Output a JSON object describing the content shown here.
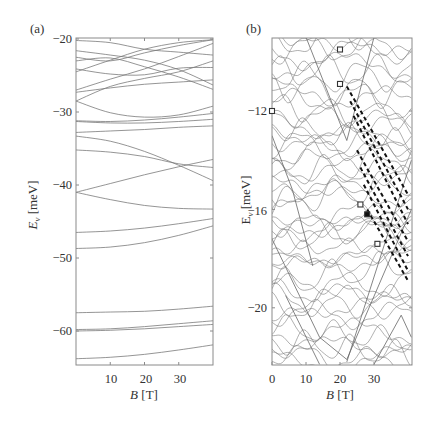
{
  "chart_data": [
    {
      "panel": "(a)",
      "type": "line",
      "title": "",
      "xlabel": "B [T]",
      "ylabel": "E_ν [meV]",
      "xlim": [
        0,
        40
      ],
      "ylim": [
        -64.6,
        -20
      ],
      "xticks": [
        10,
        20,
        30
      ],
      "yticks": [
        -20,
        -30,
        -40,
        -50,
        -60
      ],
      "grid": false,
      "legend": null,
      "series": [
        {
          "name": "level",
          "x": [
            0,
            10,
            20,
            30,
            40
          ],
          "y": [
            -20.2,
            -20.5,
            -21.4,
            -21.8,
            -22.2
          ]
        },
        {
          "name": "level",
          "x": [
            0,
            10,
            20,
            30,
            40
          ],
          "y": [
            -21.6,
            -22.2,
            -22.9,
            -24.2,
            -26.3
          ]
        },
        {
          "name": "level",
          "x": [
            0,
            10,
            20,
            30,
            40
          ],
          "y": [
            -22.5,
            -23.0,
            -21.9,
            -20.9,
            -20.1
          ]
        },
        {
          "name": "level",
          "x": [
            0,
            10,
            20,
            30,
            40
          ],
          "y": [
            -23.0,
            -22.6,
            -23.8,
            -25.2,
            -26.9
          ]
        },
        {
          "name": "level",
          "x": [
            0,
            10,
            20,
            30,
            40
          ],
          "y": [
            -24.1,
            -24.8,
            -24.9,
            -24.0,
            -23.9
          ]
        },
        {
          "name": "level",
          "x": [
            0,
            10,
            20,
            30,
            40
          ],
          "y": [
            -24.5,
            -22.9,
            -21.4,
            -20.5,
            -20.1
          ]
        },
        {
          "name": "level",
          "x": [
            0,
            10,
            20,
            30,
            40
          ],
          "y": [
            -27.0,
            -25.5,
            -24.1,
            -22.4,
            -20.6
          ]
        },
        {
          "name": "level",
          "x": [
            0,
            10,
            20,
            30,
            40
          ],
          "y": [
            -27.3,
            -26.7,
            -26.2,
            -25.9,
            -25.6
          ]
        },
        {
          "name": "level",
          "x": [
            0,
            10,
            20,
            30,
            40
          ],
          "y": [
            -28.5,
            -26.5,
            -25.4,
            -24.5,
            -23.0
          ]
        },
        {
          "name": "level",
          "x": [
            0,
            10,
            20,
            30,
            40
          ],
          "y": [
            -28.5,
            -30.1,
            -30.7,
            -30.4,
            -29.2
          ]
        },
        {
          "name": "level",
          "x": [
            0,
            10,
            20,
            30,
            40
          ],
          "y": [
            -31.2,
            -31.3,
            -31.1,
            -30.7,
            -30.2
          ]
        },
        {
          "name": "level",
          "x": [
            0,
            10,
            20,
            30,
            40
          ],
          "y": [
            -31.3,
            -31.5,
            -31.5,
            -31.3,
            -31.0
          ]
        },
        {
          "name": "level",
          "x": [
            0,
            10,
            20,
            30,
            40
          ],
          "y": [
            -32.8,
            -32.6,
            -32.4,
            -32.1,
            -31.9
          ]
        },
        {
          "name": "level",
          "x": [
            0,
            10,
            20,
            30,
            40
          ],
          "y": [
            -33.3,
            -34.0,
            -35.4,
            -37.3,
            -39.4
          ]
        },
        {
          "name": "level",
          "x": [
            0,
            10,
            20,
            30,
            40
          ],
          "y": [
            -35.2,
            -35.5,
            -36.1,
            -37.1,
            -37.6
          ]
        },
        {
          "name": "level",
          "x": [
            0,
            10,
            20,
            30,
            40
          ],
          "y": [
            -41.0,
            -39.8,
            -38.6,
            -37.5,
            -36.5
          ]
        },
        {
          "name": "level",
          "x": [
            0,
            10,
            20,
            30,
            40
          ],
          "y": [
            -41.0,
            -42.0,
            -42.8,
            -43.2,
            -43.3
          ]
        },
        {
          "name": "level",
          "x": [
            0,
            10,
            20,
            30,
            40
          ],
          "y": [
            -46.5,
            -46.3,
            -45.9,
            -45.3,
            -44.6
          ]
        },
        {
          "name": "level",
          "x": [
            0,
            10,
            20,
            30,
            40
          ],
          "y": [
            -48.7,
            -48.5,
            -47.9,
            -46.9,
            -45.6
          ]
        },
        {
          "name": "level",
          "x": [
            0,
            10,
            20,
            30,
            40
          ],
          "y": [
            -57.5,
            -57.4,
            -57.3,
            -57.0,
            -56.6
          ]
        },
        {
          "name": "level",
          "x": [
            0,
            10,
            20,
            30,
            40
          ],
          "y": [
            -59.8,
            -59.7,
            -59.4,
            -59.0,
            -58.6
          ]
        },
        {
          "name": "level",
          "x": [
            0,
            10,
            20,
            30,
            40
          ],
          "y": [
            -60.0,
            -59.9,
            -59.7,
            -59.4,
            -59.1
          ]
        },
        {
          "name": "level",
          "x": [
            0,
            10,
            20,
            30,
            40
          ],
          "y": [
            -63.8,
            -63.6,
            -63.2,
            -62.6,
            -61.9
          ]
        }
      ]
    },
    {
      "panel": "(b)",
      "type": "line",
      "title": "",
      "xlabel": "B [T]",
      "ylabel": "E_ν [meV]",
      "xlim": [
        0,
        41
      ],
      "ylim": [
        -22.3,
        -9.0
      ],
      "xticks": [
        0,
        10,
        20,
        30
      ],
      "yticks": [
        -12,
        -16,
        -20
      ],
      "grid": false,
      "legend": null,
      "description": "Dense spectrum of many oscillating energy levels vs magnetic field; V-shaped level crossings; a family of parallel dashed bold lines descending to the right from about (22,-11) to (40,-18.8).",
      "dashed_series": [
        {
          "x": [
            22,
            40
          ],
          "y": [
            -11.0,
            -15.4
          ]
        },
        {
          "x": [
            23,
            40
          ],
          "y": [
            -11.6,
            -16.0
          ]
        },
        {
          "x": [
            24,
            40
          ],
          "y": [
            -12.2,
            -16.6
          ]
        },
        {
          "x": [
            25,
            40
          ],
          "y": [
            -13.6,
            -17.3
          ]
        },
        {
          "x": [
            26,
            40
          ],
          "y": [
            -14.3,
            -17.9
          ]
        },
        {
          "x": [
            27,
            40
          ],
          "y": [
            -15.0,
            -18.5
          ]
        },
        {
          "x": [
            28,
            40
          ],
          "y": [
            -16.0,
            -18.9
          ]
        }
      ],
      "markers": [
        {
          "x": 20,
          "y": -9.5,
          "style": "open-square"
        },
        {
          "x": 20,
          "y": -10.9,
          "style": "open-square"
        },
        {
          "x": 0,
          "y": -12.0,
          "style": "open-square"
        },
        {
          "x": 26,
          "y": -15.8,
          "style": "open-square"
        },
        {
          "x": 28,
          "y": -16.2,
          "style": "filled-square"
        },
        {
          "x": 31,
          "y": -17.4,
          "style": "open-square"
        }
      ]
    }
  ],
  "labels": {
    "panel_a": "(a)",
    "panel_b": "(b)",
    "xlabel_var": "B",
    "xlabel_unit": "[T]",
    "ylabel_var": "E",
    "ylabel_sub": "ν",
    "ylabel_unit": "[meV]",
    "a_yticks": [
      "−20",
      "−30",
      "−40",
      "−50",
      "−60"
    ],
    "a_xticks": [
      "10",
      "20",
      "30"
    ],
    "b_yticks": [
      "−12",
      "−16",
      "−20"
    ],
    "b_xticks": [
      "0",
      "10",
      "20",
      "30"
    ]
  },
  "colors": {
    "line": "#7a7a7a",
    "frame": "#8a8a8a",
    "dash": "#111111",
    "text": "#333333"
  }
}
